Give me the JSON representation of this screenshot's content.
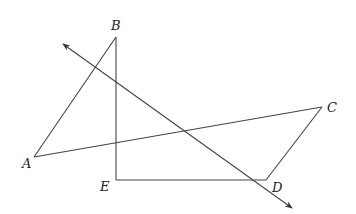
{
  "diagram": {
    "points": {
      "A": {
        "label": "A",
        "x": 34,
        "y": 157,
        "lx": 22,
        "ly": 168
      },
      "B": {
        "label": "B",
        "x": 116,
        "y": 37,
        "lx": 111,
        "ly": 30
      },
      "C": {
        "label": "C",
        "x": 322,
        "y": 107,
        "lx": 327,
        "ly": 112
      },
      "D": {
        "label": "D",
        "x": 266,
        "y": 180,
        "lx": 272,
        "ly": 192
      },
      "E": {
        "label": "E",
        "x": 116,
        "y": 180,
        "lx": 100,
        "ly": 191
      }
    },
    "segments": [
      {
        "from": "A",
        "to": "B"
      },
      {
        "from": "B",
        "to": "E"
      },
      {
        "from": "E",
        "to": "D"
      },
      {
        "from": "D",
        "to": "C"
      },
      {
        "from": "C",
        "to": "A"
      }
    ],
    "line": {
      "x1": 63,
      "y1": 44,
      "x2": 292,
      "y2": 208,
      "arrows": "both"
    },
    "stroke_color": "#444444"
  }
}
